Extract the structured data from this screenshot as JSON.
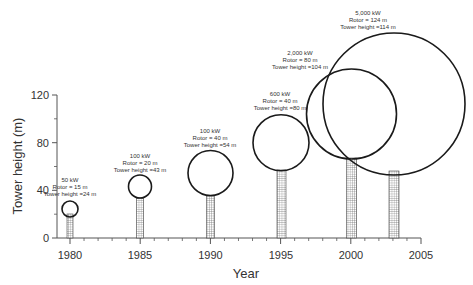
{
  "chart_data": {
    "type": "scatter",
    "title": "",
    "xlabel": "Year",
    "ylabel": "Tower height (m)",
    "xlim": [
      1980,
      2005
    ],
    "ylim": [
      0,
      120
    ],
    "x_ticks": [
      1980,
      1985,
      1990,
      1995,
      2000,
      2005
    ],
    "y_ticks": [
      0,
      40,
      80,
      120
    ],
    "grid": false,
    "legend": null,
    "series": [
      {
        "name": "Wind turbines",
        "points": [
          {
            "year": 1980,
            "power": "50 kW",
            "rotor_m": 15,
            "tower_height_m": 24,
            "label_lines": [
              "50 kW",
              "Rotor = 15 m",
              "Tower height =24 m"
            ]
          },
          {
            "year": 1985,
            "power": "100 kW",
            "rotor_m": 20,
            "tower_height_m": 43,
            "label_lines": [
              "100 kW",
              "Rotor = 20 m",
              "Tower height =43 m"
            ]
          },
          {
            "year": 1990,
            "power": "100 kW",
            "rotor_m": 40,
            "tower_height_m": 54,
            "label_lines": [
              "100 kW",
              "Rotor = 40 m",
              "Tower height =54 m"
            ]
          },
          {
            "year": 1995,
            "power": "600 kW",
            "rotor_m": 40,
            "tower_height_m": 80,
            "label_lines": [
              "600 kW",
              "Rotor = 40 m",
              "Tower height =80 m"
            ]
          },
          {
            "year": 2000,
            "power": "2,000 kW",
            "rotor_m": 80,
            "tower_height_m": 104,
            "label_lines": [
              "2,000 kW",
              "Rotor = 80 m",
              "Tower height =104 m"
            ]
          },
          {
            "year": 2003,
            "power": "5,000 kW",
            "rotor_m": 124,
            "tower_height_m": 114,
            "label_lines": [
              "5,000 kW",
              "Rotor = 124 m",
              "Tower height =114 m"
            ]
          }
        ]
      }
    ]
  },
  "axes": {
    "x_title": "Year",
    "y_title": "Tower height (m)",
    "x_tick_labels": [
      "1980",
      "1985",
      "1990",
      "1995",
      "2000",
      "2005"
    ],
    "y_tick_labels": [
      "0",
      "40",
      "80",
      "120"
    ]
  },
  "turbines": [
    {
      "l1": "50 kW",
      "l2": "Rotor = 15 m",
      "l3": "Tower height =24 m"
    },
    {
      "l1": "100 kW",
      "l2": "Rotor = 20 m",
      "l3": "Tower height =43 m"
    },
    {
      "l1": "100 kW",
      "l2": "Rotor = 40 m",
      "l3": "Tower height =54 m"
    },
    {
      "l1": "600 kW",
      "l2": "Rotor = 40 m",
      "l3": "Tower height =80 m"
    },
    {
      "l1": "2,000 kW",
      "l2": "Rotor = 80 m",
      "l3": "Tower height =104 m"
    },
    {
      "l1": "5,000 kW",
      "l2": "Rotor = 124 m",
      "l3": "Tower height =114 m"
    }
  ],
  "colors": {
    "stroke": "#1a1a1a",
    "axis": "#555555",
    "text": "#333333"
  }
}
